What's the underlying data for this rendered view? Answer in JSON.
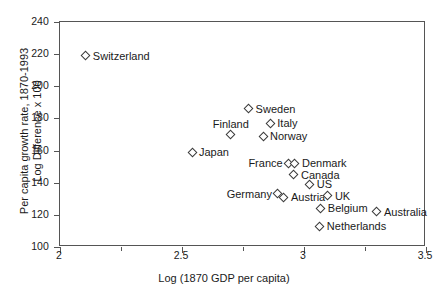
{
  "chart_data": {
    "type": "scatter",
    "title": "",
    "xlabel": "Log (1870 GDP per capita)",
    "ylabel_line1": "Per capita growth rate, 1870-1993",
    "ylabel_line2": "Log Difference x 100",
    "xlim": [
      2,
      3.5
    ],
    "ylim": [
      100,
      240
    ],
    "xticks": [
      "2",
      "2.5",
      "3",
      "3.5"
    ],
    "xtick_values": [
      2,
      2.5,
      3,
      3.5
    ],
    "xticks_minor": [
      2.25,
      2.75,
      3.25
    ],
    "yticks": [
      "100",
      "120",
      "140",
      "160",
      "180",
      "200",
      "220",
      "240"
    ],
    "ytick_values": [
      100,
      120,
      140,
      160,
      180,
      200,
      220,
      240
    ],
    "grid": false,
    "legend": "none",
    "marker": "open-diamond",
    "points": [
      {
        "label": "Switzerland",
        "x": 2.106,
        "y": 219,
        "label_pos": "right"
      },
      {
        "label": "Sweden",
        "x": 2.773,
        "y": 186,
        "label_pos": "right"
      },
      {
        "label": "Italy",
        "x": 2.862,
        "y": 177,
        "label_pos": "right"
      },
      {
        "label": "Finland",
        "x": 2.7,
        "y": 170,
        "label_pos": "above"
      },
      {
        "label": "Norway",
        "x": 2.832,
        "y": 169,
        "label_pos": "right"
      },
      {
        "label": "Japan",
        "x": 2.541,
        "y": 159,
        "label_pos": "right"
      },
      {
        "label": "France",
        "x": 2.937,
        "y": 152,
        "label_pos": "left"
      },
      {
        "label": "Denmark",
        "x": 2.963,
        "y": 152,
        "label_pos": "right"
      },
      {
        "label": "Canada",
        "x": 2.959,
        "y": 145,
        "label_pos": "right"
      },
      {
        "label": "US",
        "x": 3.024,
        "y": 139,
        "label_pos": "right"
      },
      {
        "label": "Germany",
        "x": 2.893,
        "y": 133,
        "label_pos": "left"
      },
      {
        "label": "Austria",
        "x": 2.918,
        "y": 131,
        "label_pos": "right"
      },
      {
        "label": "UK",
        "x": 3.098,
        "y": 132,
        "label_pos": "right"
      },
      {
        "label": "Belgium",
        "x": 3.069,
        "y": 124,
        "label_pos": "right"
      },
      {
        "label": "Australia",
        "x": 3.299,
        "y": 122,
        "label_pos": "right"
      },
      {
        "label": "Netherlands",
        "x": 3.065,
        "y": 113,
        "label_pos": "right"
      }
    ]
  }
}
